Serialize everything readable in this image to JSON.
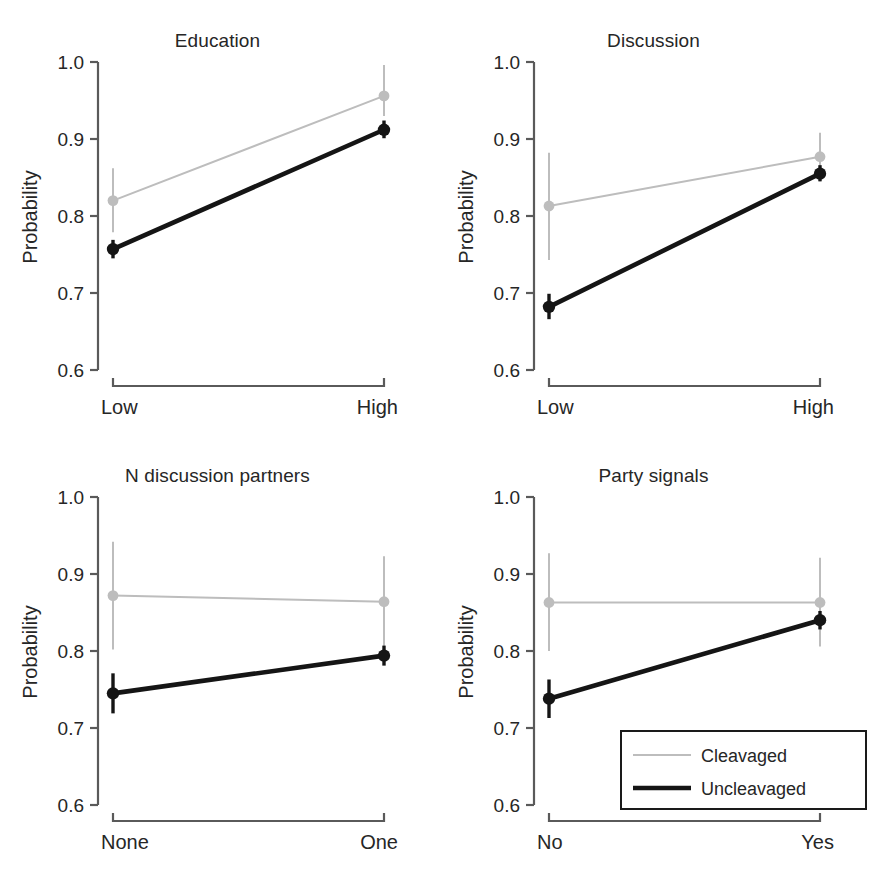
{
  "figure": {
    "width": 871,
    "height": 869,
    "background": "#ffffff",
    "layout": "2x2 small multiples"
  },
  "axis": {
    "ylabel": "Probability",
    "yticks": [
      "0.6",
      "0.7",
      "0.8",
      "0.9",
      "1.0"
    ],
    "ylim": [
      0.6,
      1.0
    ]
  },
  "legend": {
    "position": "bottom-right panel, lower right",
    "items": [
      {
        "label": "Cleavaged",
        "color": "#bdbdbd"
      },
      {
        "label": "Uncleavaged",
        "color": "#151515"
      }
    ]
  },
  "colors": {
    "cleavaged": "#bdbdbd",
    "uncleavaged": "#151515",
    "axis": "#5a5a5a",
    "text": "#262626"
  },
  "chart_data": [
    {
      "type": "line",
      "title": "Education",
      "xlabel": "",
      "ylabel": "Probability",
      "categories": [
        "Low",
        "High"
      ],
      "ylim": [
        0.6,
        1.0
      ],
      "yticks": [
        0.6,
        0.7,
        0.8,
        0.9,
        1.0
      ],
      "grid": false,
      "errorbars": true,
      "series": [
        {
          "name": "Cleavaged",
          "color": "#bdbdbd",
          "values": [
            0.82,
            0.956
          ],
          "ci_low": [
            0.779,
            0.93
          ],
          "ci_high": [
            0.862,
            0.996
          ]
        },
        {
          "name": "Uncleavaged",
          "color": "#151515",
          "values": [
            0.757,
            0.912
          ],
          "ci_low": [
            0.745,
            0.901
          ],
          "ci_high": [
            0.769,
            0.924
          ]
        }
      ]
    },
    {
      "type": "line",
      "title": "Discussion",
      "xlabel": "",
      "ylabel": "Probability",
      "categories": [
        "Low",
        "High"
      ],
      "ylim": [
        0.6,
        1.0
      ],
      "yticks": [
        0.6,
        0.7,
        0.8,
        0.9,
        1.0
      ],
      "grid": false,
      "errorbars": true,
      "series": [
        {
          "name": "Cleavaged",
          "color": "#bdbdbd",
          "values": [
            0.813,
            0.877
          ],
          "ci_low": [
            0.743,
            0.845
          ],
          "ci_high": [
            0.882,
            0.908
          ]
        },
        {
          "name": "Uncleavaged",
          "color": "#151515",
          "values": [
            0.682,
            0.855
          ],
          "ci_low": [
            0.666,
            0.845
          ],
          "ci_high": [
            0.699,
            0.866
          ]
        }
      ]
    },
    {
      "type": "line",
      "title": "N discussion partners",
      "xlabel": "",
      "ylabel": "Probability",
      "categories": [
        "None",
        "One"
      ],
      "ylim": [
        0.6,
        1.0
      ],
      "yticks": [
        0.6,
        0.7,
        0.8,
        0.9,
        1.0
      ],
      "grid": false,
      "errorbars": true,
      "series": [
        {
          "name": "Cleavaged",
          "color": "#bdbdbd",
          "values": [
            0.872,
            0.864
          ],
          "ci_low": [
            0.802,
            0.805
          ],
          "ci_high": [
            0.942,
            0.923
          ]
        },
        {
          "name": "Uncleavaged",
          "color": "#151515",
          "values": [
            0.745,
            0.794
          ],
          "ci_low": [
            0.719,
            0.781
          ],
          "ci_high": [
            0.771,
            0.807
          ]
        }
      ]
    },
    {
      "type": "line",
      "title": "Party signals",
      "xlabel": "",
      "ylabel": "Probability",
      "categories": [
        "No",
        "Yes"
      ],
      "ylim": [
        0.6,
        1.0
      ],
      "yticks": [
        0.6,
        0.7,
        0.8,
        0.9,
        1.0
      ],
      "grid": false,
      "errorbars": true,
      "series": [
        {
          "name": "Cleavaged",
          "color": "#bdbdbd",
          "values": [
            0.863,
            0.863
          ],
          "ci_low": [
            0.8,
            0.806
          ],
          "ci_high": [
            0.927,
            0.921
          ]
        },
        {
          "name": "Uncleavaged",
          "color": "#151515",
          "values": [
            0.738,
            0.84
          ],
          "ci_low": [
            0.713,
            0.828
          ],
          "ci_high": [
            0.763,
            0.852
          ]
        }
      ]
    }
  ]
}
